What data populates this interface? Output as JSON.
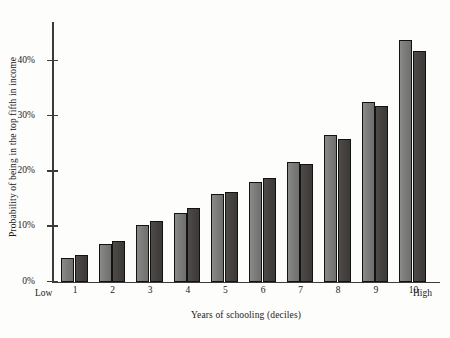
{
  "chart_data": {
    "type": "bar",
    "title": "",
    "xlabel": "Years of schooling (deciles)",
    "ylabel": "Probability of being in the top fifth in income",
    "categories": [
      "1",
      "2",
      "3",
      "4",
      "5",
      "6",
      "7",
      "8",
      "9",
      "10"
    ],
    "ytick_labels": [
      "0%",
      "10%",
      "20%",
      "30%",
      "40%"
    ],
    "ytick_values": [
      0,
      10,
      20,
      30,
      40
    ],
    "ylim": [
      0,
      47
    ],
    "grid": false,
    "legend": "none",
    "axis_end_labels": {
      "left": "Low",
      "right": "High"
    },
    "series": [
      {
        "name": "series-light",
        "color": "#7c7c7a",
        "values": [
          4.3,
          6.8,
          10.2,
          12.4,
          15.8,
          18.1,
          21.7,
          26.6,
          32.6,
          43.8
        ]
      },
      {
        "name": "series-dark",
        "color": "#44413f",
        "values": [
          4.8,
          7.4,
          11.0,
          13.4,
          16.2,
          18.7,
          21.4,
          25.8,
          31.8,
          41.8
        ]
      }
    ]
  }
}
